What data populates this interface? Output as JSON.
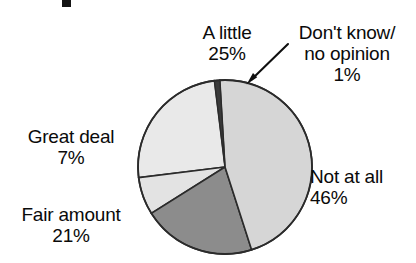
{
  "chart_data": {
    "type": "pie",
    "title": "",
    "xlabel": "",
    "ylabel": "",
    "legend_position": "callout-labels",
    "grid": false,
    "categories": [
      "A little",
      "Don't know/ no opinion",
      "Not at all",
      "Fair amount",
      "Great deal"
    ],
    "values": [
      25,
      1,
      46,
      21,
      7
    ],
    "unit": "%",
    "slices": [
      {
        "key": "a_little",
        "label": "A little",
        "value": 25,
        "value_text": "25%",
        "color": "#e9e9e9",
        "start_angle_deg": 263,
        "sweep_deg": 90
      },
      {
        "key": "dont_know",
        "label_line1": "Don't know/",
        "label_line2": "no opinion",
        "value": 1,
        "value_text": "1%",
        "color": "#3a3a3a",
        "start_angle_deg": 353,
        "sweep_deg": 3.6
      },
      {
        "key": "not_at_all",
        "label": "Not at all",
        "value": 46,
        "value_text": "46%",
        "color": "#d6d6d6",
        "start_angle_deg": 356.6,
        "sweep_deg": 165.6
      },
      {
        "key": "fair_amount",
        "label": "Fair amount",
        "value": 21,
        "value_text": "21%",
        "color": "#8c8c8c",
        "start_angle_deg": 162.2,
        "sweep_deg": 75.6
      },
      {
        "key": "great_deal",
        "label": "Great deal",
        "value": 7,
        "value_text": "7%",
        "color": "#e3e3e3",
        "start_angle_deg": 237.8,
        "sweep_deg": 25.2
      }
    ],
    "geometry": {
      "center_x": 225,
      "center_y": 167,
      "radius": 87
    },
    "colors": {
      "outline": "#2b2b2b",
      "background": "#ffffff",
      "text": "#0a0a0a"
    },
    "annotations": [
      {
        "key": "dont-know-arrow",
        "type": "arrow",
        "from_x": 288,
        "from_y": 44,
        "to_x": 248,
        "to_y": 83
      }
    ]
  },
  "labels": {
    "a_little": {
      "name": "A little",
      "value": "25%"
    },
    "dont_know": {
      "line1": "Don't know/",
      "line2": "no opinion",
      "value": "1%"
    },
    "not_at_all": {
      "name": "Not at all",
      "value": "46%"
    },
    "fair_amount": {
      "name": "Fair amount",
      "value": "21%"
    },
    "great_deal": {
      "name": "Great deal",
      "value": "7%"
    }
  }
}
